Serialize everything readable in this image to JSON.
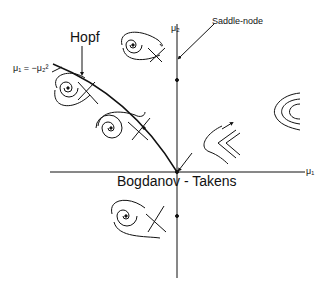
{
  "diagram": {
    "type": "bifurcation-diagram",
    "labels": {
      "hopf": "Hopf",
      "saddle_node": "Saddle-node",
      "bogdanov_takens": "Bogdanov - Takens",
      "mu1_axis": "μ₁",
      "mu2_axis": "μ₂",
      "curve_equation": "μ₁ = −μ₂²"
    },
    "axes": {
      "horizontal": "μ1",
      "vertical": "μ2",
      "origin": "Bogdanov-Takens point"
    },
    "phase_portraits": [
      {
        "region": "upper-left between axis and Hopf",
        "description": "spiral with saddle, loop"
      },
      {
        "region": "left of Hopf curve (upper)",
        "description": "stable spiral with saddle"
      },
      {
        "region": "left of Hopf curve (lower)",
        "description": "spiral with homoclinic-like loop and saddle"
      },
      {
        "region": "right of μ2 axis near origin",
        "description": "saddle-node cusp flow"
      },
      {
        "region": "right half-plane",
        "description": "no equilibria, parallel curved flow"
      },
      {
        "region": "lower-left",
        "description": "spiral and saddle"
      }
    ]
  }
}
